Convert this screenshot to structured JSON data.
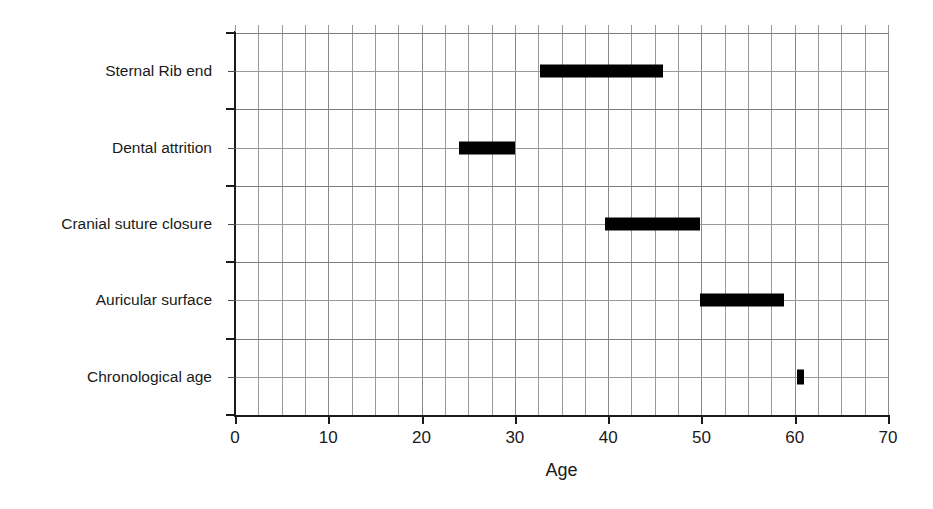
{
  "chart_data": {
    "type": "bar",
    "orientation": "horizontal",
    "subtype": "range-bar",
    "title": "",
    "xlabel": "Age",
    "ylabel": "",
    "xlim": [
      0,
      70
    ],
    "xticks": [
      0,
      10,
      20,
      30,
      40,
      50,
      60,
      70
    ],
    "xtick_labels": [
      "0",
      "10",
      "20",
      "30",
      "40",
      "50",
      "60",
      "70"
    ],
    "x_minor_tick_step": 2.5,
    "grid": true,
    "grid_color": "#9a9a9a",
    "bar_color": "#000000",
    "background": "#ffffff",
    "legend": false,
    "categories": [
      "Sternal Rib end",
      "Dental attrition",
      "Cranial suture closure",
      "Auricular surface",
      "Chronological age"
    ],
    "ranges": [
      {
        "category": "Sternal Rib end",
        "start": 32.7,
        "end": 45.9,
        "label": "33 – 46"
      },
      {
        "category": "Dental attrition",
        "start": 24.0,
        "end": 30.0,
        "label": "24 – 30"
      },
      {
        "category": "Cranial suture closure",
        "start": 39.7,
        "end": 49.9,
        "label": "40 – 50"
      },
      {
        "category": "Auricular surface",
        "start": 49.8,
        "end": 58.9,
        "label": "50 – 59"
      },
      {
        "category": "Chronological age",
        "start": 60.2,
        "end": 60.9,
        "label": "60.5"
      }
    ]
  },
  "axis": {
    "x_title": "Age",
    "tick_0": "0",
    "tick_10": "10",
    "tick_20": "20",
    "tick_30": "30",
    "tick_40": "40",
    "tick_50": "50",
    "tick_60": "60",
    "tick_70": "70"
  },
  "categories": {
    "c0": "Sternal Rib end",
    "c1": "Dental attrition",
    "c2": "Cranial suture closure",
    "c3": "Auricular surface",
    "c4": "Chronological age"
  }
}
